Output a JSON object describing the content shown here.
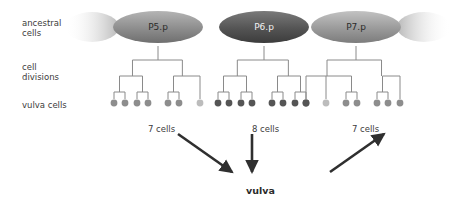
{
  "diagram": {
    "row_labels": [
      {
        "id": "ancestral-cells",
        "text": "ancestral\ncells",
        "x": 22,
        "y": 18
      },
      {
        "id": "cell-divisions",
        "text": "cell\ndivisions",
        "x": 22,
        "y": 62
      },
      {
        "id": "vulva-cells",
        "text": "vulva cells",
        "x": 22,
        "y": 100
      }
    ],
    "faded_ellipses": [
      {
        "id": "faded-left",
        "cx": 92,
        "cy": 27,
        "rx": 27,
        "ry": 15,
        "direction": "left"
      },
      {
        "id": "faded-right",
        "cx": 424,
        "cy": 27,
        "rx": 27,
        "ry": 15,
        "direction": "right"
      }
    ],
    "precursors": [
      {
        "id": "p5p",
        "label": "P5.p",
        "cx": 158,
        "cy": 27,
        "rx": 45,
        "ry": 16,
        "shade": "medium",
        "color": "#8d8d8d"
      },
      {
        "id": "p6p",
        "label": "P6.p",
        "cx": 264,
        "cy": 27,
        "rx": 45,
        "ry": 16,
        "shade": "dark",
        "color": "#585858"
      },
      {
        "id": "p7p",
        "label": "P7.p",
        "cx": 356,
        "cy": 27,
        "rx": 45,
        "ry": 16,
        "shade": "medium",
        "color": "#9a9a9a"
      }
    ],
    "lineages": [
      {
        "id": "lineage-p5p",
        "precursor": "P5.p",
        "trunk_x": 158,
        "cell_count_label": "7 cells",
        "cell_count_x": 148,
        "cell_count_y": 124,
        "leaf_y": 103,
        "leaves": [
          {
            "x": 114,
            "shade": "medium"
          },
          {
            "x": 125,
            "shade": "medium"
          },
          {
            "x": 137,
            "shade": "medium"
          },
          {
            "x": 148,
            "shade": "medium"
          },
          {
            "x": 168,
            "shade": "medium"
          },
          {
            "x": 179,
            "shade": "medium"
          },
          {
            "x": 200,
            "shade": "light"
          }
        ]
      },
      {
        "id": "lineage-p6p",
        "precursor": "P6.p",
        "trunk_x": 264,
        "cell_count_label": "8 cells",
        "cell_count_x": 252,
        "cell_count_y": 124,
        "leaf_y": 103,
        "leaves": [
          {
            "x": 218,
            "shade": "dark"
          },
          {
            "x": 229,
            "shade": "dark"
          },
          {
            "x": 241,
            "shade": "dark"
          },
          {
            "x": 252,
            "shade": "dark"
          },
          {
            "x": 272,
            "shade": "dark"
          },
          {
            "x": 283,
            "shade": "dark"
          },
          {
            "x": 295,
            "shade": "dark"
          },
          {
            "x": 306,
            "shade": "dark"
          }
        ]
      },
      {
        "id": "lineage-p7p",
        "precursor": "P7.p",
        "trunk_x": 356,
        "cell_count_label": "7 cells",
        "cell_count_x": 352,
        "cell_count_y": 124,
        "leaf_y": 103,
        "leaves": [
          {
            "x": 306,
            "shade": "dark"
          },
          {
            "x": 326,
            "shade": "light"
          },
          {
            "x": 346,
            "shade": "medium"
          },
          {
            "x": 357,
            "shade": "medium"
          },
          {
            "x": 377,
            "shade": "medium"
          },
          {
            "x": 388,
            "shade": "medium"
          },
          {
            "x": 400,
            "shade": "medium"
          }
        ]
      }
    ],
    "arrows": [
      {
        "id": "arrow-left",
        "x1": 178,
        "y1": 134,
        "x2": 232,
        "y2": 172
      },
      {
        "id": "arrow-middle",
        "x1": 252,
        "y1": 134,
        "x2": 252,
        "y2": 172
      },
      {
        "id": "arrow-right",
        "x1": 330,
        "y1": 172,
        "x2": 384,
        "y2": 134
      }
    ],
    "outcome": {
      "id": "vulva-outcome",
      "label": "vulva",
      "x": 246,
      "y": 185
    },
    "colors": {
      "cell_dark": "#555555",
      "cell_medium": "#8d8d8d",
      "cell_light": "#bcbcbc",
      "tree_line": "#8a8a8a",
      "arrow": "#2f2f2f",
      "text": "#3c3c3c"
    }
  }
}
